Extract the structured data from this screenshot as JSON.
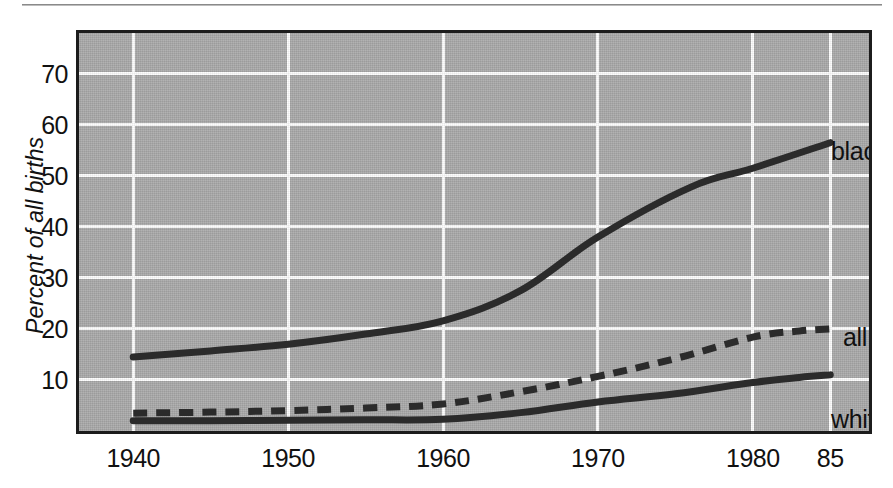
{
  "figure": {
    "background_color": "#ffffff",
    "plot_background_color": "#a9a9a9",
    "gridline_color": "#fdfdfd",
    "line_color": "#2b2b2b",
    "frame_color": "#1c1c1c"
  },
  "axes": {
    "ylabel": "Percent of all births",
    "yticks": [
      "10",
      "20",
      "30",
      "40",
      "50",
      "60",
      "70"
    ],
    "xticks": [
      "1940",
      "1950",
      "1960",
      "1970",
      "1980",
      "85"
    ]
  },
  "annotations": {
    "black": "black",
    "all": "all",
    "white": "white"
  },
  "chart_data": {
    "type": "line",
    "title": "",
    "subtitle": "",
    "xlabel": "",
    "ylabel": "Percent of all births",
    "xlim": [
      1936.5,
      1987.5
    ],
    "ylim": [
      0,
      78
    ],
    "xticks": [
      1940,
      1950,
      1960,
      1970,
      1980,
      1985
    ],
    "xticklabels": [
      "1940",
      "1950",
      "1960",
      "1970",
      "1980",
      "85"
    ],
    "yticks": [
      10,
      20,
      30,
      40,
      50,
      60,
      70
    ],
    "yticklabels": [
      "10",
      "20",
      "30",
      "40",
      "50",
      "60",
      "70"
    ],
    "grid": true,
    "grid_axis": "both",
    "legend": "inline-annotations",
    "legend_position": "right-of-line-ends",
    "series": [
      {
        "name": "black",
        "label": "black",
        "style": "solid",
        "color": "#2b2b2b",
        "linewidth_px": 7,
        "x": [
          1940,
          1945,
          1950,
          1955,
          1960,
          1965,
          1970,
          1976,
          1980,
          1985
        ],
        "values": [
          14.5,
          15.7,
          17.0,
          19.0,
          21.6,
          27.5,
          38.0,
          47.8,
          51.5,
          56.5
        ]
      },
      {
        "name": "all",
        "label": "all",
        "style": "dashed",
        "color": "#2b2b2b",
        "linewidth_px": 7,
        "x": [
          1940,
          1945,
          1950,
          1955,
          1960,
          1965,
          1970,
          1975,
          1980,
          1983,
          1985
        ],
        "values": [
          3.5,
          3.7,
          4.0,
          4.5,
          5.3,
          7.7,
          10.7,
          14.2,
          18.4,
          19.6,
          20.0
        ]
      },
      {
        "name": "white",
        "label": "white",
        "style": "solid",
        "color": "#2b2b2b",
        "linewidth_px": 7,
        "x": [
          1940,
          1945,
          1950,
          1955,
          1960,
          1965,
          1970,
          1975,
          1980,
          1983,
          1985
        ],
        "values": [
          2.0,
          2.0,
          2.1,
          2.2,
          2.3,
          3.6,
          5.7,
          7.3,
          9.5,
          10.5,
          11.0
        ]
      }
    ]
  }
}
